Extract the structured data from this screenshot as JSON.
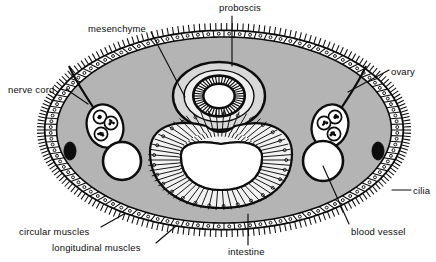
{
  "figure": {
    "kind": "biological-cross-section-diagram",
    "background_color": "#ffffff",
    "ink_color": "#0d0d0d",
    "mesenchyme_fill": "#b4b4b4",
    "lumen_fill": "#ffffff",
    "stipple_color": "#111111"
  },
  "labels": [
    {
      "id": "mesenchyme",
      "text": "mesenchyme",
      "x": 88,
      "y": 23
    },
    {
      "id": "proboscis",
      "text": "proboscis",
      "x": 219,
      "y": 2
    },
    {
      "id": "nerve-cord",
      "text": "nerve cord",
      "x": 8,
      "y": 84
    },
    {
      "id": "ovary",
      "text": "ovary",
      "x": 391,
      "y": 66
    },
    {
      "id": "cilia",
      "text": "cilia",
      "x": 413,
      "y": 185
    },
    {
      "id": "circular-muscles",
      "text": "circular muscles",
      "x": 19,
      "y": 226
    },
    {
      "id": "longitudinal-muscles",
      "text": "longitudinal muscles",
      "x": 52,
      "y": 242
    },
    {
      "id": "intestine",
      "text": "intestine",
      "x": 228,
      "y": 246
    },
    {
      "id": "blood-vessel",
      "text": "blood vessel",
      "x": 351,
      "y": 226
    }
  ],
  "leader_lines": [
    {
      "id": "mesenchyme-leader",
      "from": [
        151,
        32
      ],
      "to": [
        185,
        97
      ]
    },
    {
      "id": "proboscis-leader",
      "from": [
        232,
        16
      ],
      "to": [
        232,
        66
      ]
    },
    {
      "id": "nerve-cord-leader",
      "from": [
        66,
        89
      ],
      "to": [
        88,
        104
      ]
    },
    {
      "id": "ovary-leader",
      "from": [
        389,
        70
      ],
      "to": [
        348,
        92
      ]
    },
    {
      "id": "cilia-leader",
      "from": [
        411,
        190
      ],
      "to": [
        392,
        190
      ]
    },
    {
      "id": "circular-muscles-leader",
      "from": [
        101,
        227
      ],
      "to": [
        124,
        214
      ]
    },
    {
      "id": "longitudinal-muscles-leader",
      "from": [
        156,
        243
      ],
      "to": [
        176,
        226
      ]
    },
    {
      "id": "intestine-leader",
      "from": [
        248,
        245
      ],
      "to": [
        248,
        214
      ]
    },
    {
      "id": "blood-vessel-leader",
      "from": [
        349,
        224
      ],
      "to": [
        323,
        166
      ]
    }
  ],
  "structures": {
    "body_outline": {
      "name": "body-wall-ellipse",
      "cx": 224,
      "cy": 130,
      "rx": 180,
      "ry": 100
    },
    "proboscis": {
      "name": "proboscis-ring",
      "cx": 219,
      "cy": 96,
      "rx": 46,
      "ry": 34
    },
    "intestine": {
      "name": "intestine-lumen",
      "cx": 220,
      "cy": 160
    },
    "ovaries": [
      {
        "name": "ovary-left",
        "cx": 105,
        "cy": 126,
        "cells": 3
      },
      {
        "name": "ovary-right",
        "cx": 330,
        "cy": 126,
        "cells": 3
      }
    ],
    "blood_vessels": [
      {
        "name": "blood-vessel-left",
        "cx": 122,
        "cy": 161,
        "r": 19
      },
      {
        "name": "blood-vessel-right",
        "cx": 323,
        "cy": 161,
        "r": 20
      }
    ],
    "nerve_cords": [
      {
        "name": "nerve-cord-left",
        "cx": 70,
        "cy": 151,
        "rx": 6,
        "ry": 9
      },
      {
        "name": "nerve-cord-right",
        "cx": 378,
        "cy": 151,
        "rx": 6,
        "ry": 9
      }
    ]
  }
}
